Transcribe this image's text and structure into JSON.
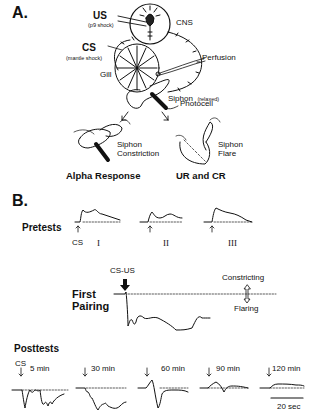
{
  "panel_a": {
    "label": "A.",
    "us": {
      "title": "US",
      "subtitle": "(p9 shock)"
    },
    "cs": {
      "title": "CS",
      "subtitle": "(mantle shock)"
    },
    "cns": "CNS",
    "perfusion": "Perfusion",
    "gill": "Gill",
    "siphon": {
      "title": "Siphon",
      "state": "(relaxed)"
    },
    "photocell": "Photocell",
    "left_outcome": {
      "line1": "Siphon",
      "line2": "Constriction",
      "caption": "Alpha Response"
    },
    "right_outcome": {
      "line1": "Siphon",
      "line2": "Flare",
      "caption": "UR and CR"
    }
  },
  "panel_b": {
    "label": "B.",
    "pretests": {
      "title": "Pretests",
      "stimulus": "CS",
      "trials": [
        "I",
        "II",
        "III"
      ]
    },
    "first_pairing": {
      "title_line1": "First",
      "title_line2": "Pairing",
      "stimulus": "CS-US",
      "direction_up": "Constricting",
      "direction_down": "Flaring"
    },
    "posttests": {
      "title": "Posttests",
      "stimulus": "CS",
      "intervals": [
        "5 min",
        "30 min",
        "60 min",
        "90 min",
        "120 min"
      ],
      "scale_bar": "20 sec"
    }
  }
}
